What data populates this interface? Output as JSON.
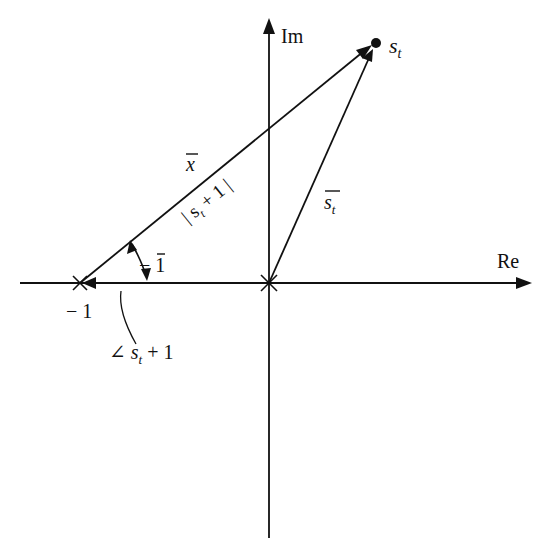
{
  "diagram": {
    "type": "complex-plane vector diagram",
    "axes": {
      "real_label": "Re",
      "imag_label": "Im"
    },
    "points": {
      "minus_one_label": "− 1",
      "st_label": "s",
      "st_sub": "t"
    },
    "vector_labels": {
      "x_bar": "x",
      "st_bar": "s",
      "st_bar_sub": "t",
      "magnitude_prefix": "| s",
      "magnitude_sub": "t",
      "magnitude_suffix": " + 1 |",
      "neg_one_bar": "− 1",
      "angle_symbol": "∠",
      "angle_s": " s",
      "angle_sub": "t",
      "angle_suffix": " + 1"
    },
    "colors": {
      "ink": "#111111",
      "background": "#ffffff"
    }
  }
}
